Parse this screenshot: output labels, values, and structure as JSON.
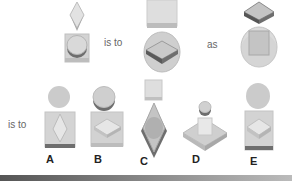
{
  "puzzle": {
    "type": "visual analogy",
    "question_row": {
      "figure_1": {
        "top": "diamond (vertical)",
        "bottom": "square with circle/cylinder"
      },
      "connector_1": "is to",
      "figure_2": {
        "top": "square with base",
        "bottom": "circle/disc with flat diamond slab"
      },
      "connector_2": "as",
      "figure_3": {
        "top": "flat diamond slab",
        "bottom": "circle/disc with square"
      }
    },
    "answer_row": {
      "connector": "is to",
      "options": [
        {
          "label": "A",
          "top": "circle",
          "bottom": "square with vertical diamond, dark base"
        },
        {
          "label": "B",
          "top": "cylinder",
          "bottom": "square with flat diamond slab"
        },
        {
          "label": "C",
          "top": "small square",
          "bottom": "vertical diamond with circle inside"
        },
        {
          "label": "D",
          "top": "small cylinder",
          "bottom": "flat diamond slab with square"
        },
        {
          "label": "E",
          "top": "circle",
          "bottom": "square with flat diamond slab, dark base"
        }
      ]
    }
  },
  "colors": {
    "light_gray": "#d6d6d6",
    "mid_gray": "#b8b8b8",
    "dark_gray": "#6e6e6e",
    "edge_gray": "#8a8a8a",
    "label_color": "#222222",
    "text_color": "#666666"
  }
}
